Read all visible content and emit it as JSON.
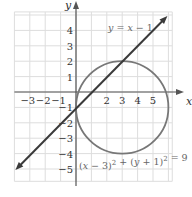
{
  "chart_data": {
    "type": "line",
    "title": "",
    "xlabel": "x",
    "ylabel": "y",
    "xlim": [
      -4,
      6.5
    ],
    "ylim": [
      -6,
      5.5
    ],
    "grid": true,
    "x_ticks": [
      -3,
      -2,
      -1,
      2,
      3,
      4,
      5
    ],
    "y_ticks": [
      4,
      3,
      2,
      1,
      -1,
      -2,
      -3,
      -4,
      -5
    ],
    "x_tick_labels": [
      "−3",
      "−2",
      "−1",
      "2",
      "3",
      "4",
      "5"
    ],
    "y_tick_labels": [
      "4",
      "3",
      "2",
      "1",
      "−1",
      "−2",
      "−3",
      "−4",
      "−5"
    ],
    "series": [
      {
        "name": "y = x − 1",
        "kind": "line",
        "equation": "y = x - 1",
        "x": [
          -4,
          6
        ],
        "y": [
          -5,
          5
        ],
        "arrows": "both"
      },
      {
        "name": "(x − 3)² + (y + 1)² = 9",
        "kind": "circle",
        "center": [
          3,
          -1
        ],
        "radius": 3
      }
    ],
    "annotations": [
      {
        "text": "y = x − 1",
        "x": 2.6,
        "y": 3.8
      },
      {
        "text": "(x − 3)² + (y + 1)² = 9",
        "x": 0.2,
        "y": -4.8
      }
    ],
    "intersection_points": [
      [
        0,
        -1
      ],
      [
        3,
        2
      ]
    ]
  },
  "labels": {
    "x_axis": "x",
    "y_axis": "y",
    "line_label": "y = x − 1",
    "circle_label_parts": [
      "(x − 3)",
      "2",
      " + (y + 1)",
      "2",
      " = 9"
    ]
  },
  "colors": {
    "grid": "#dddddd",
    "axis": "#555555",
    "line": "#3a3a3a",
    "circle": "#777777",
    "text": "#333333"
  }
}
